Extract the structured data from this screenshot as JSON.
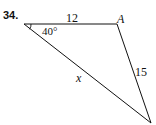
{
  "problem": {
    "number": "34.",
    "side_top": "12",
    "side_right": "15",
    "side_unknown": "x",
    "angle": "40°",
    "vertex_label": "A"
  },
  "colors": {
    "stroke": "#111111",
    "background": "#ffffff"
  }
}
